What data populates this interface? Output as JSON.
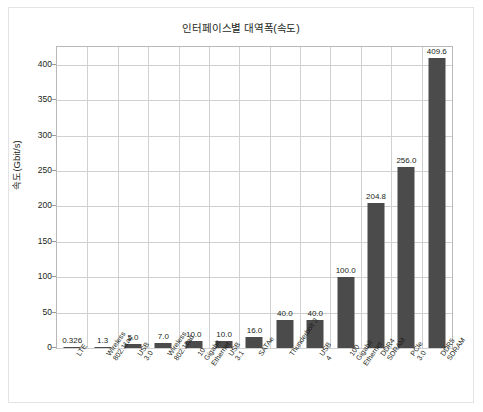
{
  "chart_data": {
    "type": "bar",
    "title": "인터페이스별 대역폭(속도)",
    "xlabel": "",
    "ylabel": "속도(Gbit/s)",
    "ylim": [
      0,
      425
    ],
    "yticks": [
      0,
      50,
      100,
      150,
      200,
      250,
      300,
      350,
      400
    ],
    "ytick_labels": [
      "0",
      "50",
      "100",
      "150",
      "200",
      "250",
      "300",
      "350",
      "400"
    ],
    "grid": true,
    "legend": false,
    "bar_color": "#4b4b4b",
    "categories": [
      "LTE",
      "Wireless\n802.11ac",
      "USB\n3.0",
      "Wireless\n802.11ad",
      "10\nGigabit\nEthernet",
      "USB\n3.1",
      "SATAe",
      "Thunderbolt 3",
      "USB\n4",
      "100\nGigabit\nEthernet",
      "DDR4\nSDRAM",
      "PCIe\n3.0",
      "DDR5\nSDRAM"
    ],
    "values": [
      0.326,
      1.3,
      5.0,
      7.0,
      10.0,
      10.0,
      16.0,
      40.0,
      40.0,
      100.0,
      204.8,
      256.0,
      409.6
    ],
    "value_labels": [
      "0.326",
      "1.3",
      "5.0",
      "7.0",
      "10.0",
      "10.0",
      "16.0",
      "40.0",
      "40.0",
      "100.0",
      "204.8",
      "256.0",
      "409.6"
    ]
  }
}
